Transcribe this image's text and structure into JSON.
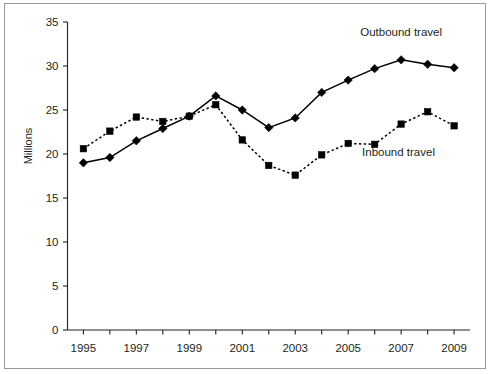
{
  "chart_data": {
    "type": "line",
    "title": "",
    "subtitle": "",
    "xlabel": "",
    "ylabel": "Millions",
    "xlim": [
      1994.4,
      2009.6
    ],
    "ylim": [
      0,
      35
    ],
    "yticks": [
      0,
      5,
      10,
      15,
      20,
      25,
      30,
      35
    ],
    "ytick_labels": [
      "0",
      "5",
      "10",
      "15",
      "20",
      "25",
      "30",
      "35"
    ],
    "xticks": [
      1995,
      1996,
      1997,
      1998,
      1999,
      2000,
      2001,
      2002,
      2003,
      2004,
      2005,
      2006,
      2007,
      2008,
      2009
    ],
    "xtick_labels": [
      "1995",
      "",
      "1997",
      "",
      "1999",
      "",
      "2001",
      "",
      "2003",
      "",
      "2005",
      "",
      "2007",
      "",
      "2009"
    ],
    "x": [
      1995,
      1996,
      1997,
      1998,
      1999,
      2000,
      2001,
      2002,
      2003,
      2004,
      2005,
      2006,
      2007,
      2008,
      2009
    ],
    "grid": false,
    "legend_position": "inline-annotations",
    "series": [
      {
        "name": "Outbound travel",
        "marker": "diamond",
        "linestyle": "solid",
        "color": "#000000",
        "values": [
          19.0,
          19.6,
          21.5,
          22.9,
          24.3,
          26.6,
          25.0,
          23.0,
          24.1,
          27.0,
          28.4,
          29.7,
          30.7,
          30.2,
          29.8
        ]
      },
      {
        "name": "Inbound travel",
        "marker": "square",
        "linestyle": "dotted",
        "color": "#000000",
        "values": [
          20.6,
          22.6,
          24.2,
          23.7,
          24.3,
          25.6,
          21.6,
          18.7,
          17.6,
          19.9,
          21.2,
          21.1,
          23.4,
          24.8,
          23.2
        ]
      }
    ],
    "annotations": [
      {
        "text": "Outbound travel",
        "x": 2007.0,
        "y": 33.4
      },
      {
        "text": "Inbound travel",
        "x": 2006.9,
        "y": 19.8
      }
    ]
  },
  "figure": {
    "border_color": "#9a9a9a",
    "background": "#ffffff",
    "axis_color": "#231f20"
  }
}
